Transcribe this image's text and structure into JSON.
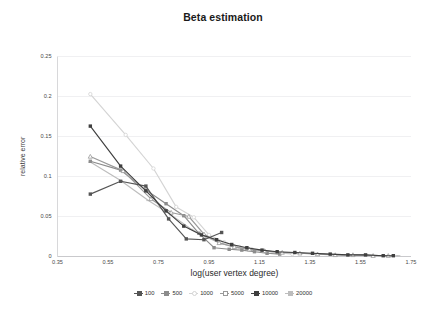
{
  "chart_data": {
    "type": "line",
    "title": "Beta estimation",
    "xlabel": "log(user vertex degree)",
    "ylabel": "relative error",
    "xlim": [
      0.35,
      1.75
    ],
    "ylim": [
      0,
      0.25
    ],
    "xticks": [
      "0.35",
      "0.55",
      "0.75",
      "0.95",
      "1.15",
      "1.35",
      "1.55",
      "1.75"
    ],
    "yticks": [
      "0",
      "0.05",
      "0.1",
      "0.15",
      "0.2",
      "0.25"
    ],
    "grid": "horizontal-faint",
    "legend_position": "bottom",
    "series": [
      {
        "name": "100",
        "color": "#555555",
        "marker": "square",
        "x": [
          0.48,
          0.6,
          0.7,
          0.79,
          0.86,
          0.93,
          1.0
        ],
        "y": [
          0.078,
          0.094,
          0.088,
          0.047,
          0.022,
          0.021,
          0.03
        ]
      },
      {
        "name": "500",
        "color": "#8c8c8c",
        "marker": "square",
        "x": [
          0.48,
          0.6,
          0.7,
          0.78,
          0.85,
          0.91,
          0.97,
          1.03,
          1.08,
          1.13,
          1.18,
          1.23
        ],
        "y": [
          0.119,
          0.108,
          0.083,
          0.066,
          0.051,
          0.029,
          0.011,
          0.009,
          0.008,
          0.006,
          0.004,
          0.003
        ]
      },
      {
        "name": "1000",
        "color": "#d4d4d4",
        "marker": "circle",
        "x": [
          0.48,
          0.62,
          0.73,
          0.82,
          0.89,
          0.95,
          1.01,
          1.07,
          1.12,
          1.17,
          1.22,
          1.28
        ],
        "y": [
          0.203,
          0.152,
          0.11,
          0.062,
          0.049,
          0.027,
          0.018,
          0.012,
          0.009,
          0.007,
          0.005,
          0.003
        ]
      },
      {
        "name": "5000",
        "color": "#9a9a9a",
        "marker": "triangle",
        "x": [
          0.48,
          0.61,
          0.72,
          0.8,
          0.87,
          0.93,
          0.99,
          1.05,
          1.11,
          1.17,
          1.24,
          1.31,
          1.38,
          1.45,
          1.52,
          1.6,
          1.66
        ],
        "y": [
          0.125,
          0.107,
          0.072,
          0.055,
          0.05,
          0.028,
          0.017,
          0.012,
          0.009,
          0.007,
          0.005,
          0.004,
          0.003,
          0.002,
          0.002,
          0.001,
          0.001
        ]
      },
      {
        "name": "10000",
        "color": "#3f3f3f",
        "marker": "square",
        "x": [
          0.48,
          0.6,
          0.7,
          0.78,
          0.85,
          0.92,
          0.98,
          1.04,
          1.1,
          1.16,
          1.22,
          1.29,
          1.36,
          1.43,
          1.5,
          1.57,
          1.64,
          1.68
        ],
        "y": [
          0.163,
          0.113,
          0.082,
          0.057,
          0.038,
          0.027,
          0.021,
          0.015,
          0.011,
          0.008,
          0.006,
          0.005,
          0.004,
          0.003,
          0.002,
          0.002,
          0.001,
          0.001
        ]
      },
      {
        "name": "20000",
        "color": "#bdbdbd",
        "marker": "dash",
        "x": [
          0.48,
          0.6,
          0.71,
          0.8,
          0.88,
          0.94,
          1.0,
          1.06,
          1.12,
          1.18,
          1.25,
          1.32,
          1.4,
          1.48,
          1.56,
          1.64,
          1.7
        ],
        "y": [
          0.118,
          0.095,
          0.07,
          0.052,
          0.034,
          0.024,
          0.016,
          0.011,
          0.008,
          0.006,
          0.005,
          0.004,
          0.003,
          0.002,
          0.002,
          0.001,
          0.001
        ]
      }
    ]
  },
  "legend": {
    "items": [
      {
        "label": "100"
      },
      {
        "label": "500"
      },
      {
        "label": "1000"
      },
      {
        "label": "5000"
      },
      {
        "label": "10000"
      },
      {
        "label": "20000"
      }
    ]
  }
}
